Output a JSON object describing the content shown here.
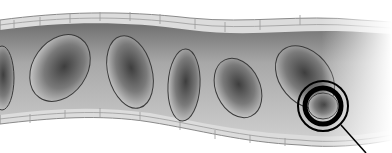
{
  "figure": {
    "style": "grayscale illustration",
    "colors": {
      "background": "#ffffff",
      "vessel_wall": "#d9d9d9",
      "vessel_wall_line": "#8a8a8a",
      "lumen": "#b5b5b5",
      "cell_dark": "#4a4a4a",
      "cell_light": "#d0d0d0",
      "highlight_ring": "#000000",
      "pointer_line": "#000000"
    },
    "cells": [
      {
        "cx": 2,
        "cy": 95,
        "rx": 14,
        "ry": 33,
        "rot": 10
      },
      {
        "cx": 60,
        "cy": 68,
        "rx": 28,
        "ry": 36,
        "rot": 35
      },
      {
        "cx": 130,
        "cy": 72,
        "rx": 22,
        "ry": 37,
        "rot": -15
      },
      {
        "cx": 184,
        "cy": 83,
        "rx": 16,
        "ry": 36,
        "rot": 3
      },
      {
        "cx": 238,
        "cy": 89,
        "rx": 22,
        "ry": 31,
        "rot": -25
      },
      {
        "cx": 310,
        "cy": 77,
        "rx": 27,
        "ry": 35,
        "rot": -40
      },
      {
        "cx": 323,
        "cy": 129,
        "rx": 16,
        "ry": 14,
        "rot": 0
      }
    ],
    "highlight": {
      "cx": 323,
      "cy": 107,
      "r_outer": 26,
      "r_inner": 20
    },
    "pointer": {
      "x1": 342,
      "y1": 124,
      "x2": 368,
      "y2": 153
    }
  }
}
